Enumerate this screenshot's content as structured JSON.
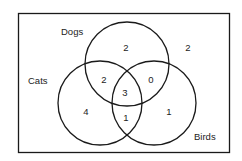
{
  "diagram": {
    "type": "venn",
    "sets": [
      {
        "name": "Dogs",
        "label": "Dogs"
      },
      {
        "name": "Cats",
        "label": "Cats"
      },
      {
        "name": "Birds",
        "label": "Birds"
      }
    ],
    "regions": {
      "dogs_only": "2",
      "cats_only": "4",
      "birds_only": "1",
      "dogs_cats": "2",
      "dogs_birds": "0",
      "cats_birds": "1",
      "all_three": "3",
      "outside": "2"
    },
    "colors": {
      "stroke": "#1a1a1a",
      "text": "#222222",
      "background": "#ffffff"
    }
  }
}
